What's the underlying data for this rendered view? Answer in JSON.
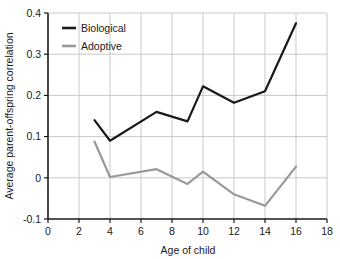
{
  "chart_data": {
    "type": "line",
    "title": "",
    "xlabel": "Age of child",
    "ylabel": "Average parent-offspring correlation",
    "xlim": [
      0,
      18
    ],
    "ylim": [
      -0.1,
      0.4
    ],
    "xticks": [
      "0",
      "2",
      "4",
      "6",
      "8",
      "10",
      "12",
      "14",
      "16",
      "18"
    ],
    "xtick_values": [
      0,
      2,
      4,
      6,
      8,
      10,
      12,
      14,
      16,
      18
    ],
    "yticks": [
      "0.4",
      "0.3",
      "0.2",
      "0.1",
      "0",
      "-0.1"
    ],
    "ytick_values": [
      0.4,
      0.3,
      0.2,
      0.1,
      0,
      -0.1
    ],
    "grid": true,
    "legend_position": "top-left",
    "x": [
      3,
      4,
      7,
      9,
      10,
      12,
      14,
      16
    ],
    "series": [
      {
        "name": "Biological",
        "color": "#1a1a1a",
        "values": [
          0.14,
          0.09,
          0.16,
          0.137,
          0.222,
          0.182,
          0.21,
          0.375
        ]
      },
      {
        "name": "Adoptive",
        "color": "#999999",
        "values": [
          0.088,
          0.002,
          0.021,
          -0.015,
          0.015,
          -0.04,
          -0.068,
          0.027
        ]
      }
    ]
  },
  "legend": {
    "items": [
      {
        "label": "Biological"
      },
      {
        "label": "Adoptive"
      }
    ]
  },
  "axes": {
    "x_title": "Age of child",
    "y_title": "Average parent-offspring correlation",
    "x_tick_labels": [
      "0",
      "2",
      "4",
      "6",
      "8",
      "10",
      "12",
      "14",
      "16",
      "18"
    ],
    "y_tick_labels": [
      "0.4",
      "0.3",
      "0.2",
      "0.1",
      "0",
      "-0.1"
    ]
  },
  "colors": {
    "biological": "#1a1a1a",
    "adoptive": "#999999",
    "grid": "#c9c9c9",
    "axis": "#1a1a1a",
    "background": "#ffffff"
  }
}
